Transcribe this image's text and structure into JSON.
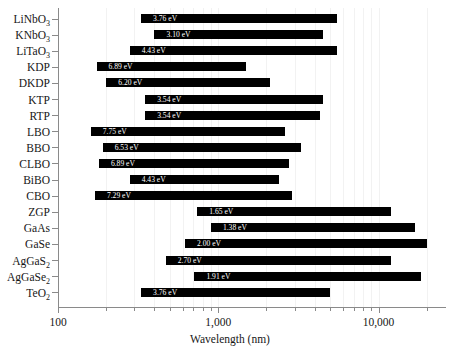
{
  "chart_data": {
    "type": "bar",
    "orientation": "horizontal-range",
    "title": "",
    "xlabel": "Wavelength (nm)",
    "ylabel": "",
    "xscale": "log",
    "xlim": [
      100,
      26000
    ],
    "xtick_labels": [
      "100",
      "1,000",
      "10,000"
    ],
    "xtick_values": [
      100,
      1000,
      10000
    ],
    "grid": true,
    "legend": null,
    "annotation_note": "Each bar spans the transparency wavelength range of the material; the white in-bar label is the bandgap energy in eV.",
    "categories": [
      "LiNbO3",
      "KNbO3",
      "LiTaO3",
      "KDP",
      "DKDP",
      "KTP",
      "RTP",
      "LBO",
      "BBO",
      "CLBO",
      "BiBO",
      "CBO",
      "ZGP",
      "GaAs",
      "GaSe",
      "AgGaS2",
      "AgGaSe2",
      "TeO2"
    ],
    "bars": [
      {
        "name": "LiNbO3",
        "label_html": "LiNbO<sub>3</sub>",
        "start_nm": 330,
        "end_nm": 5500,
        "energy": "3.76 eV"
      },
      {
        "name": "KNbO3",
        "label_html": "KNbO<sub>3</sub>",
        "start_nm": 400,
        "end_nm": 4500,
        "energy": "3.10 eV"
      },
      {
        "name": "LiTaO3",
        "label_html": "LiTaO<sub>3</sub>",
        "start_nm": 280,
        "end_nm": 5500,
        "energy": "4.43 eV"
      },
      {
        "name": "KDP",
        "label_html": "KDP",
        "start_nm": 174,
        "end_nm": 1500,
        "energy": "6.89 eV"
      },
      {
        "name": "DKDP",
        "label_html": "DKDP",
        "start_nm": 200,
        "end_nm": 2100,
        "energy": "6.20 eV"
      },
      {
        "name": "KTP",
        "label_html": "KTP",
        "start_nm": 350,
        "end_nm": 4500,
        "energy": "3.54 eV"
      },
      {
        "name": "RTP",
        "label_html": "RTP",
        "start_nm": 350,
        "end_nm": 4300,
        "energy": "3.54 eV"
      },
      {
        "name": "LBO",
        "label_html": "LBO",
        "start_nm": 160,
        "end_nm": 2600,
        "energy": "7.75 eV"
      },
      {
        "name": "BBO",
        "label_html": "BBO",
        "start_nm": 190,
        "end_nm": 3300,
        "energy": "6.53 eV"
      },
      {
        "name": "CLBO",
        "label_html": "CLBO",
        "start_nm": 180,
        "end_nm": 2750,
        "energy": "6.89 eV"
      },
      {
        "name": "BiBO",
        "label_html": "BiBO",
        "start_nm": 280,
        "end_nm": 2400,
        "energy": "4.43 eV"
      },
      {
        "name": "CBO",
        "label_html": "CBO",
        "start_nm": 170,
        "end_nm": 2900,
        "energy": "7.29 eV"
      },
      {
        "name": "ZGP",
        "label_html": "ZGP",
        "start_nm": 740,
        "end_nm": 12000,
        "energy": "1.65 eV"
      },
      {
        "name": "GaAs",
        "label_html": "GaAs",
        "start_nm": 900,
        "end_nm": 17000,
        "energy": "1.38 eV"
      },
      {
        "name": "GaSe",
        "label_html": "GaSe",
        "start_nm": 620,
        "end_nm": 20000,
        "energy": "2.00 eV"
      },
      {
        "name": "AgGaS2",
        "label_html": "AgGaS<sub>2</sub>",
        "start_nm": 470,
        "end_nm": 12000,
        "energy": "2.70 eV"
      },
      {
        "name": "AgGaSe2",
        "label_html": "AgGaSe<sub>2</sub>",
        "start_nm": 710,
        "end_nm": 18500,
        "energy": "1.91 eV"
      },
      {
        "name": "TeO2",
        "label_html": "TeO<sub>2</sub>",
        "start_nm": 330,
        "end_nm": 5000,
        "energy": "3.76 eV"
      }
    ]
  },
  "colors": {
    "bar": "#000000",
    "bar_label": "#ffffff",
    "axis": "#8a8a8a",
    "text": "#171717",
    "background": "#ffffff",
    "grid": "#f2f2f2"
  }
}
